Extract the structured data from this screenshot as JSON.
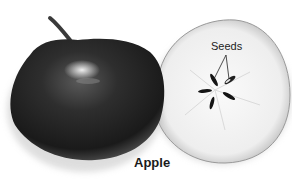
{
  "figure": {
    "caption": "Apple",
    "labels": [
      {
        "text": "Seeds",
        "target": "seeds in cross-section core"
      }
    ],
    "parts": [
      {
        "name": "whole-apple",
        "description": "dark whole apple with stem and highlight"
      },
      {
        "name": "apple-cross-section",
        "description": "pale cut slice showing star-shaped seed arrangement"
      }
    ],
    "colors": {
      "apple_dark": "#1c1c1c",
      "apple_mid": "#3a3a3a",
      "flesh": "#f4f4f4",
      "seed": "#141414"
    }
  }
}
